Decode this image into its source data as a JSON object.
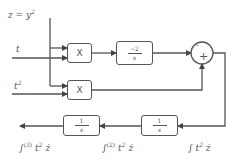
{
  "diagram": {
    "inputs": {
      "z": "z = y",
      "z_exp": "2",
      "t": "t",
      "t2": "t",
      "t2_exp": "2"
    },
    "blocks": {
      "mult_top": "X",
      "mult_bottom": "X",
      "gain_num": "−2",
      "gain_den": "s",
      "integrator_right_num": "1",
      "integrator_right_den": "s",
      "integrator_left_num": "1",
      "integrator_left_den": "s"
    },
    "sum": {
      "top_sign": "-",
      "bottom_sign": "+"
    },
    "outputs": {
      "int1": "∫ t",
      "int1_exp": "2",
      "int1_tail": " ż",
      "int2": "∫",
      "int2_sup": "(2)",
      "int2_mid": " t",
      "int2_exp": "2",
      "int2_tail": " ż",
      "int3": "∫",
      "int3_sup": "(3)",
      "int3_mid": " t",
      "int3_exp": "2",
      "int3_tail": " ż"
    },
    "colors": {
      "line": "#555555",
      "background": "#ffffff"
    }
  }
}
